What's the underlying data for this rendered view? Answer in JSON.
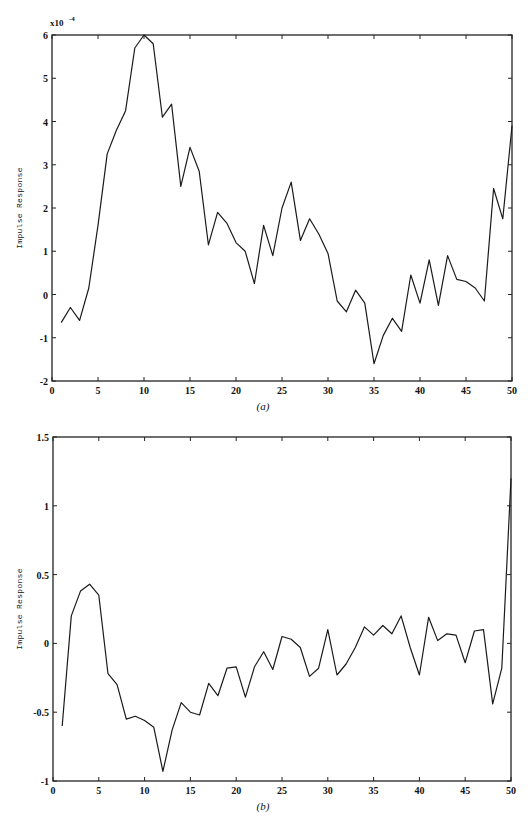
{
  "chart_data": [
    {
      "id": "a",
      "type": "line",
      "caption": "(a)",
      "title": "",
      "xlabel": "",
      "ylabel": "Impulse Response",
      "y_scale_label": "x10",
      "y_scale_exponent": "-4",
      "xlim": [
        0,
        50
      ],
      "ylim": [
        -2,
        6
      ],
      "xticks": [
        0,
        5,
        10,
        15,
        20,
        25,
        30,
        35,
        40,
        45,
        50
      ],
      "yticks": [
        -2,
        -1,
        0,
        1,
        2,
        3,
        4,
        5,
        6
      ],
      "grid": false,
      "legend": null,
      "frame": {
        "left": 52,
        "top": 35,
        "right": 512,
        "bottom": 381
      },
      "x": [
        1,
        2,
        3,
        4,
        5,
        6,
        7,
        8,
        9,
        10,
        11,
        12,
        13,
        14,
        15,
        16,
        17,
        18,
        19,
        20,
        21,
        22,
        23,
        24,
        25,
        26,
        27,
        28,
        29,
        30,
        31,
        32,
        33,
        34,
        35,
        36,
        37,
        38,
        39,
        40,
        41,
        42,
        43,
        44,
        45,
        46,
        47,
        48,
        49,
        50
      ],
      "series": [
        {
          "name": "impulse response (x1e-4)",
          "values": [
            -0.65,
            -0.3,
            -0.6,
            0.15,
            1.6,
            3.25,
            3.8,
            4.25,
            5.7,
            6.0,
            5.8,
            4.1,
            4.4,
            2.5,
            3.4,
            2.85,
            1.15,
            1.9,
            1.65,
            1.2,
            1.0,
            0.25,
            1.6,
            0.9,
            2.0,
            2.6,
            1.25,
            1.75,
            1.4,
            0.95,
            -0.15,
            -0.4,
            0.1,
            -0.2,
            -1.6,
            -0.95,
            -0.55,
            -0.85,
            0.45,
            -0.2,
            0.8,
            -0.25,
            0.9,
            0.35,
            0.3,
            0.15,
            -0.15,
            2.45,
            1.75,
            3.9
          ]
        }
      ]
    },
    {
      "id": "b",
      "type": "line",
      "caption": "(b)",
      "title": "",
      "xlabel": "",
      "ylabel": "Impulse Response",
      "xlim": [
        0,
        50
      ],
      "ylim": [
        -1,
        1.5
      ],
      "xticks": [
        0,
        5,
        10,
        15,
        20,
        25,
        30,
        35,
        40,
        45,
        50
      ],
      "yticks": [
        -1,
        -0.5,
        0,
        0.5,
        1,
        1.5
      ],
      "grid": false,
      "legend": null,
      "frame": {
        "left": 53,
        "top": 437,
        "right": 511,
        "bottom": 781
      },
      "x": [
        1,
        2,
        3,
        4,
        5,
        6,
        7,
        8,
        9,
        10,
        11,
        12,
        13,
        14,
        15,
        16,
        17,
        18,
        19,
        20,
        21,
        22,
        23,
        24,
        25,
        26,
        27,
        28,
        29,
        30,
        31,
        32,
        33,
        34,
        35,
        36,
        37,
        38,
        39,
        40,
        41,
        42,
        43,
        44,
        45,
        46,
        47,
        48,
        49,
        50
      ],
      "series": [
        {
          "name": "impulse response",
          "values": [
            -0.6,
            0.2,
            0.38,
            0.43,
            0.35,
            -0.22,
            -0.3,
            -0.55,
            -0.53,
            -0.56,
            -0.61,
            -0.93,
            -0.63,
            -0.43,
            -0.5,
            -0.52,
            -0.29,
            -0.38,
            -0.18,
            -0.17,
            -0.39,
            -0.17,
            -0.06,
            -0.19,
            0.05,
            0.03,
            -0.03,
            -0.24,
            -0.18,
            0.1,
            -0.23,
            -0.15,
            -0.03,
            0.12,
            0.06,
            0.13,
            0.07,
            0.2,
            -0.03,
            -0.23,
            0.19,
            0.02,
            0.07,
            0.06,
            -0.14,
            0.09,
            0.1,
            -0.44,
            -0.18,
            1.2
          ]
        }
      ]
    }
  ],
  "labels": {
    "caption_a": "(a)",
    "caption_b": "(b)",
    "ylabel": "Impulse Response",
    "scale_base": "x10",
    "scale_exp": "-4"
  }
}
